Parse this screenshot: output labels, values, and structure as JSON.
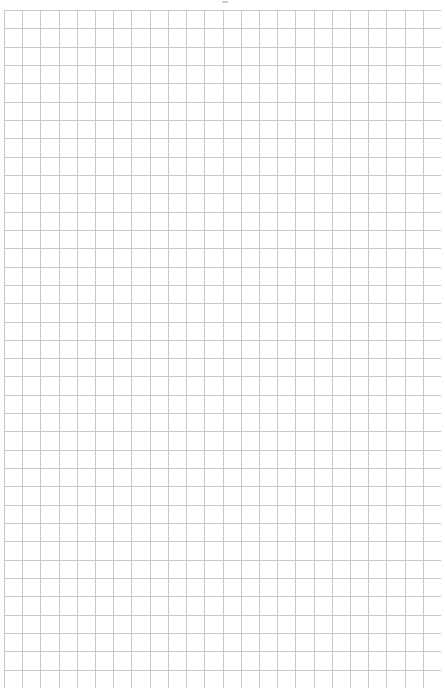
{
  "page": {
    "type": "graph-paper",
    "background": "#ffffff",
    "line_color": "#c8c8c8",
    "columns": 24,
    "rows": 37,
    "origin": [
      4,
      10
    ],
    "width": 437,
    "height": 678
  }
}
